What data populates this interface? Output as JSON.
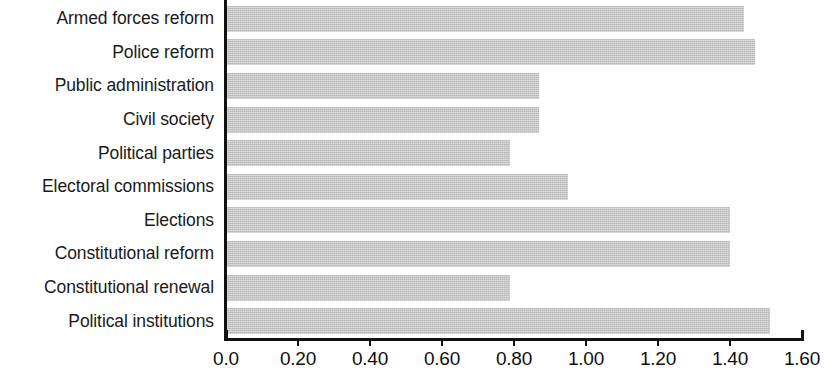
{
  "chart_data": {
    "type": "bar",
    "orientation": "horizontal",
    "title": "",
    "subtitle": "",
    "xlabel": "",
    "ylabel": "",
    "xlim": [
      0.0,
      1.6
    ],
    "grid": false,
    "legend": null,
    "categories": [
      "Armed forces reform",
      "Police reform",
      "Public administration",
      "Civil society",
      "Political parties",
      "Electoral commissions",
      "Elections",
      "Constitutional reform",
      "Constitutional renewal",
      "Political institutions"
    ],
    "values": [
      1.44,
      1.47,
      0.87,
      0.87,
      0.79,
      0.95,
      1.4,
      1.4,
      0.79,
      1.51
    ],
    "xticks": [
      0.0,
      0.2,
      0.4,
      0.6,
      0.8,
      1.0,
      1.2,
      1.4,
      1.6
    ],
    "xtick_labels": [
      "0.0",
      "0.20",
      "0.40",
      "0.60",
      "0.80",
      "1.00",
      "1.20",
      "1.40",
      "1.60"
    ],
    "bar_color": "#c6c6c6",
    "axis_color": "#111111"
  }
}
